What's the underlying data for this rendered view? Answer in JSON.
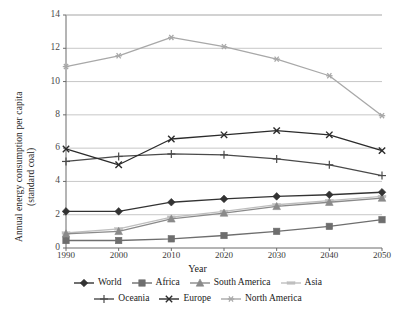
{
  "chart_data": {
    "type": "line",
    "title": "",
    "xlabel": "Year",
    "ylabel": "Annual energy consumption per capita (standard coal)",
    "ylabel_line1": "Annual energy consumption per capita",
    "ylabel_line2": "(standard coal)",
    "categories": [
      "1990",
      "2000",
      "2010",
      "2020",
      "2030",
      "2040",
      "2050"
    ],
    "x": [
      1990,
      2000,
      2010,
      2020,
      2030,
      2040,
      2050
    ],
    "ylim": [
      0,
      14
    ],
    "yticks": [
      "0",
      "2",
      "4",
      "6",
      "8",
      "10",
      "12",
      "14"
    ],
    "ytick_values": [
      0,
      2,
      4,
      6,
      8,
      10,
      12,
      14
    ],
    "grid": true,
    "legend_position": "bottom",
    "series": [
      {
        "name": "World",
        "marker": "diamond",
        "color": "#333333",
        "values": [
          2.2,
          2.2,
          2.75,
          2.95,
          3.1,
          3.2,
          3.35
        ]
      },
      {
        "name": "Africa",
        "marker": "square",
        "color": "#6e6e6e",
        "values": [
          0.45,
          0.45,
          0.55,
          0.75,
          1.0,
          1.3,
          1.7
        ]
      },
      {
        "name": "South America",
        "marker": "triangle",
        "color": "#8a8a8a",
        "values": [
          0.85,
          1.0,
          1.75,
          2.1,
          2.5,
          2.75,
          3.0
        ]
      },
      {
        "name": "Asia",
        "marker": "dash",
        "color": "#bfbfbf",
        "values": [
          0.9,
          1.15,
          1.85,
          2.2,
          2.6,
          2.85,
          3.1
        ]
      },
      {
        "name": "Oceania",
        "marker": "plus",
        "color": "#4a4a4a",
        "values": [
          5.2,
          5.5,
          5.65,
          5.6,
          5.35,
          5.0,
          4.35
        ]
      },
      {
        "name": "Europe",
        "marker": "cross",
        "color": "#2b2b2b",
        "values": [
          5.95,
          5.0,
          6.55,
          6.8,
          7.05,
          6.8,
          5.85
        ]
      },
      {
        "name": "North America",
        "marker": "asterisk",
        "color": "#a8a8a8",
        "values": [
          10.9,
          11.55,
          12.65,
          12.1,
          11.35,
          10.35,
          7.95
        ]
      }
    ]
  },
  "legend": {
    "row1": [
      "World",
      "Africa",
      "South America",
      "Asia"
    ],
    "row2": [
      "Oceania",
      "Europe",
      "North America"
    ]
  }
}
